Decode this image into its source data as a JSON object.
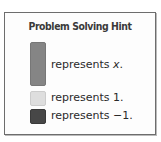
{
  "hint_box": {
    "title": "Problem Solving Hint",
    "legend": [
      {
        "tile": "x-tile",
        "color": "#858585",
        "text_prefix": "represents ",
        "value": "x",
        "suffix": "."
      },
      {
        "tile": "unit-tile",
        "color": "#dedede",
        "text": "represents 1."
      },
      {
        "tile": "negative-unit-tile",
        "color": "#474747",
        "text": "represents −1."
      }
    ]
  }
}
